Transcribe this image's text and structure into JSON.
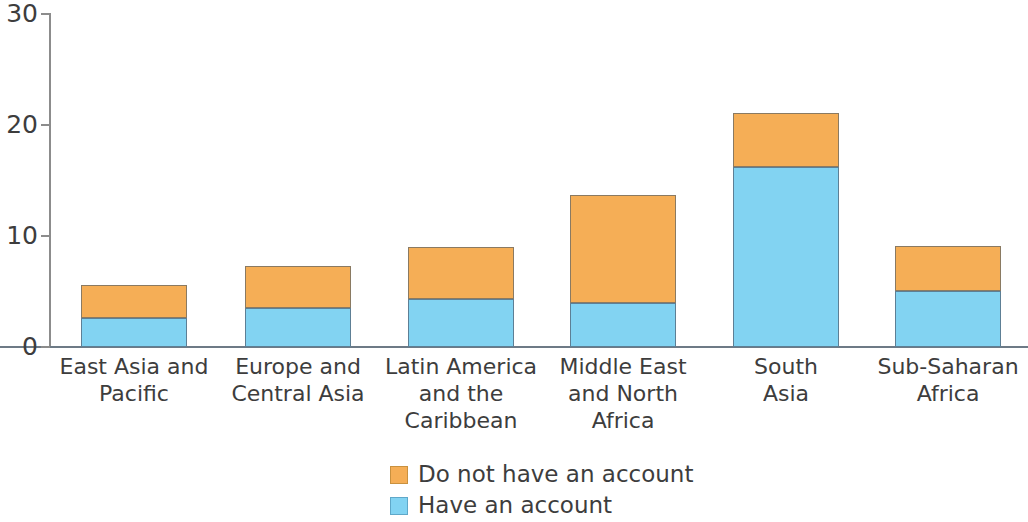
{
  "chart_data": {
    "type": "bar",
    "subtype": "stacked-bar",
    "title": "",
    "xlabel": "",
    "ylabel": "",
    "ylim": [
      0,
      30
    ],
    "yticks": [
      0,
      10,
      20,
      30
    ],
    "ytick_labels": [
      "0",
      "10",
      "20",
      "30"
    ],
    "grid": false,
    "legend_position": "bottom-center",
    "categories": [
      "East Asia and\nPacific",
      "Europe and\nCentral Asia",
      "Latin America\nand the\nCaribbean",
      "Middle East\nand North\nAfrica",
      "South\nAsia",
      "Sub-Saharan\nAfrica"
    ],
    "series": [
      {
        "name": "Have an account",
        "color": "#82D3F2",
        "values": [
          2.6,
          3.5,
          4.3,
          4.0,
          16.2,
          5.0
        ]
      },
      {
        "name": "Do not have an account",
        "color": "#F5AE56",
        "values": [
          3.0,
          3.8,
          4.7,
          9.7,
          4.9,
          4.1
        ]
      }
    ],
    "totals": [
      5.6,
      7.3,
      9.0,
      13.7,
      21.1,
      9.1
    ]
  },
  "axis": {
    "y_ticks": [
      {
        "label": "30",
        "value": 30
      },
      {
        "label": "20",
        "value": 20
      },
      {
        "label": "10",
        "value": 10
      },
      {
        "label": "0",
        "value": 0
      }
    ]
  },
  "legend": {
    "items": [
      {
        "label": "Do not have an account",
        "color": "#F5AE56"
      },
      {
        "label": "Have an account",
        "color": "#82D3F2"
      }
    ]
  },
  "colors": {
    "orange": "#F5AE56",
    "blue": "#82D3F2",
    "axis": "#8c8c8c",
    "baseline": "#6d7a86",
    "text": "#3d3d3d"
  }
}
